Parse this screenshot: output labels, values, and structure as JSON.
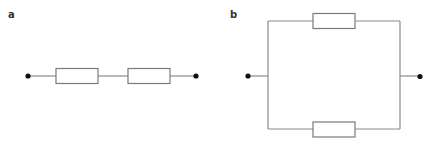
{
  "figure": {
    "panels": [
      {
        "label": "a",
        "topology": "series",
        "components": [
          {
            "type": "terminal",
            "name": "left-terminal"
          },
          {
            "type": "resistor",
            "name": "resistor-1"
          },
          {
            "type": "resistor",
            "name": "resistor-2"
          },
          {
            "type": "terminal",
            "name": "right-terminal"
          }
        ]
      },
      {
        "label": "b",
        "topology": "parallel",
        "components": [
          {
            "type": "terminal",
            "name": "left-terminal"
          },
          {
            "type": "resistor",
            "name": "resistor-top"
          },
          {
            "type": "resistor",
            "name": "resistor-bottom"
          },
          {
            "type": "terminal",
            "name": "right-terminal"
          }
        ]
      }
    ],
    "colors": {
      "wire": "#8a8a8a",
      "resistor_outline": "#7a7a7a",
      "terminal": "#111111",
      "label": "#333333",
      "background": "#ffffff"
    }
  }
}
